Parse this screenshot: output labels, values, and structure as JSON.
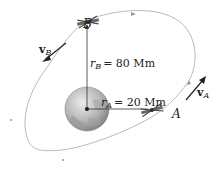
{
  "diagram": {
    "type": "orbital-mechanics",
    "labels": {
      "point_b": "B",
      "point_a": "A",
      "velocity_b": {
        "symbol": "v",
        "subscript": "B"
      },
      "velocity_a": {
        "symbol": "v",
        "subscript": "A"
      },
      "radius_b": {
        "symbol": "r",
        "subscript": "B",
        "value": "= 80 Mm"
      },
      "radius_a": {
        "symbol": "r",
        "subscript": "A",
        "value": "= 20 Mm"
      }
    },
    "colors": {
      "orbit": "#a8a8a8",
      "lines": "#333333",
      "earth_light": "#e4e4e4",
      "earth_dark": "#8c8c8c",
      "satellite": "#555555"
    }
  }
}
